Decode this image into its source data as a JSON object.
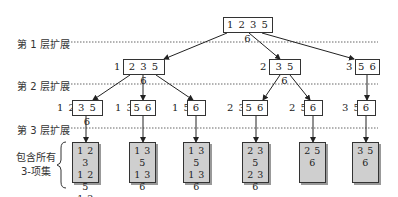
{
  "levels": [
    {
      "label": "第 1 层扩展"
    },
    {
      "label": "第 2 层扩展"
    },
    {
      "label": "第 3 层扩展"
    }
  ],
  "root": {
    "items": "1 2 3 5 6"
  },
  "level1": [
    {
      "prefix": "1",
      "items": "2 3 5 6"
    },
    {
      "prefix": "2",
      "items": "3 5 6"
    },
    {
      "prefix": "3",
      "items": "5 6"
    }
  ],
  "level2": [
    {
      "prefix": "1 2",
      "items": "3 5 6"
    },
    {
      "prefix": "1 3",
      "items": "5 6"
    },
    {
      "prefix": "1 5",
      "items": "6"
    },
    {
      "prefix": "2 3",
      "items": "5 6"
    },
    {
      "prefix": "2 5",
      "items": "6"
    },
    {
      "prefix": "3 5",
      "items": "6"
    }
  ],
  "leaves": [
    {
      "lines": [
        "1 2 3",
        "1 2 5",
        "1 2 6"
      ]
    },
    {
      "lines": [
        "1 3 5",
        "1 3 6"
      ]
    },
    {
      "lines": [
        "1 3 5",
        "1 3 6"
      ]
    },
    {
      "lines": [
        "2 3 5",
        "2 3 6"
      ]
    },
    {
      "lines": [
        "2 5 6"
      ]
    },
    {
      "lines": [
        "3 5 6"
      ]
    }
  ],
  "brace_label": {
    "line1": "包含所有",
    "line2": "3-项集"
  }
}
